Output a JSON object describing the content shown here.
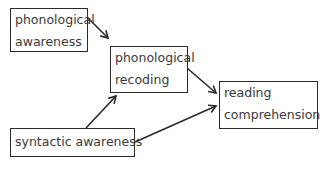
{
  "diagram": {
    "nodes": [
      {
        "id": "phon_awareness",
        "lines": [
          "phonological",
          "awareness"
        ]
      },
      {
        "id": "phon_recoding",
        "lines": [
          "phonological",
          "recoding"
        ]
      },
      {
        "id": "reading_comp",
        "lines": [
          "reading",
          "comprehension"
        ]
      },
      {
        "id": "syntactic_awareness",
        "lines": [
          "syntactic awareness"
        ]
      }
    ],
    "edges": [
      {
        "from": "phon_awareness",
        "to": "phon_recoding"
      },
      {
        "from": "phon_recoding",
        "to": "reading_comp"
      },
      {
        "from": "syntactic_awareness",
        "to": "phon_recoding"
      },
      {
        "from": "syntactic_awareness",
        "to": "reading_comp"
      }
    ],
    "colors": {
      "stroke": "#2a2a2a",
      "text": "#3a3a3a",
      "background": "#ffffff"
    }
  }
}
